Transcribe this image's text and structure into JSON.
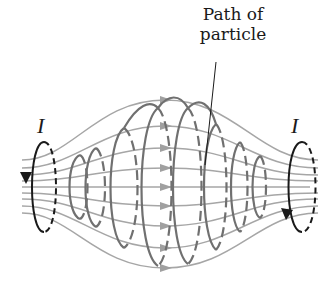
{
  "figure": {
    "labels": {
      "path_line1": "Path of",
      "path_line2": "particle",
      "current_left": "I",
      "current_right": "I"
    },
    "colors": {
      "background": "#ffffff",
      "field_line": "#a6a6a6",
      "helix": "#707070",
      "loop": "#1a1a1a",
      "text": "#1a1a1a"
    },
    "elements": [
      {
        "name": "left-current-loop",
        "description": "Current loop on left with downward arrow"
      },
      {
        "name": "right-current-loop",
        "description": "Current loop on right with arrow near bottom"
      },
      {
        "name": "magnetic-field-lines",
        "description": "Field lines bulging outward between the loops with arrowheads pointing right"
      },
      {
        "name": "particle-helical-path",
        "description": "Helical particle path wound around the field lines"
      },
      {
        "name": "leader-line",
        "description": "Line from label to particle path"
      }
    ]
  }
}
